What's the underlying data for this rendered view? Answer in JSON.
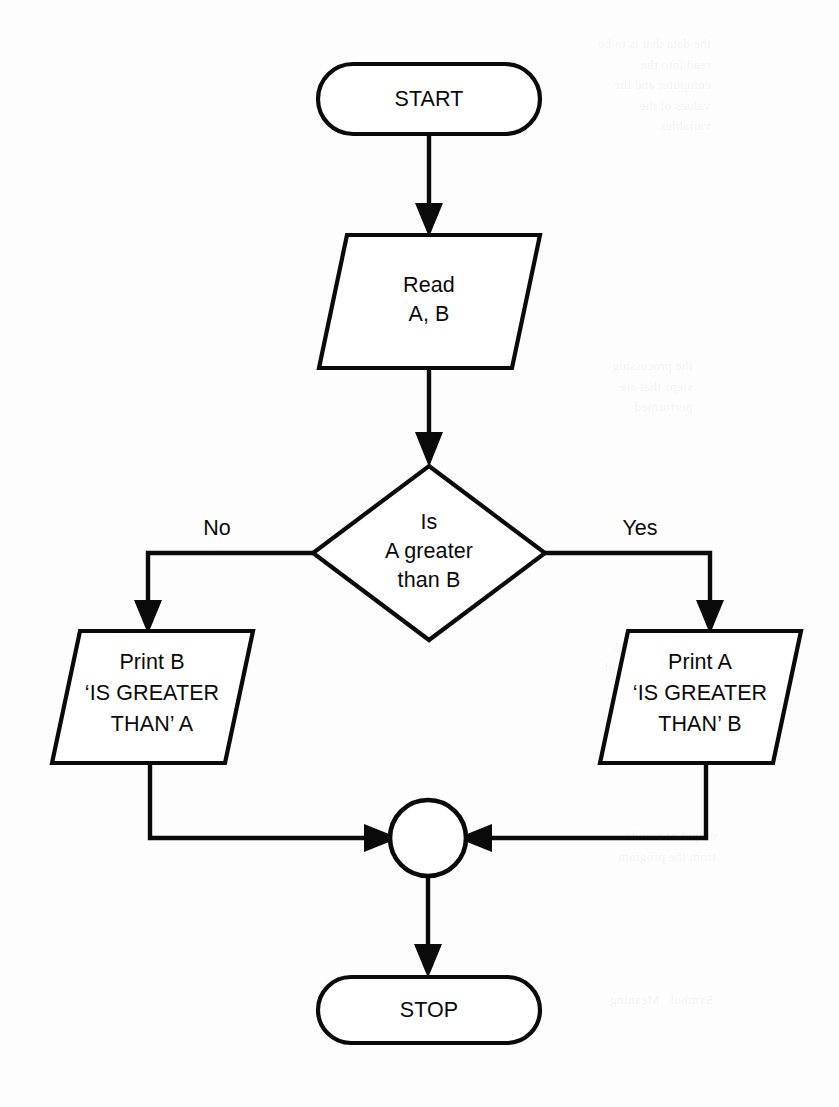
{
  "diagram": {
    "type": "flowchart",
    "background_color": "#fdfdfd",
    "line_color": "#0a0a0a",
    "shape_fill": "#ffffff"
  },
  "nodes": {
    "start": {
      "shape": "terminator",
      "label": "START"
    },
    "read": {
      "shape": "parallelogram",
      "line1": "Read",
      "line2": "A, B"
    },
    "decision": {
      "shape": "diamond",
      "line1": "Is",
      "line2": "A greater",
      "line3": "than B"
    },
    "print_b": {
      "shape": "parallelogram",
      "line1": "Print B",
      "line2": "‘IS GREATER",
      "line3": "THAN’ A"
    },
    "print_a": {
      "shape": "parallelogram",
      "line1": "Print A",
      "line2": "‘IS GREATER",
      "line3": "THAN’ B"
    },
    "connector": {
      "shape": "circle",
      "label": ""
    },
    "stop": {
      "shape": "terminator",
      "label": "STOP"
    }
  },
  "branch_labels": {
    "no": "No",
    "yes": "Yes"
  },
  "bleed_through": {
    "block_1": "the data that is to be\nread into the\ncomputer and the\nvalues of the\nvariables",
    "block_2": "the processing\nsteps that are\nperformed",
    "block_3": "a decision point\nwhere the flow of\ncontrol branches",
    "block_4": "output of results\nfrom the program",
    "block_5": "Symbol   Meaning"
  }
}
